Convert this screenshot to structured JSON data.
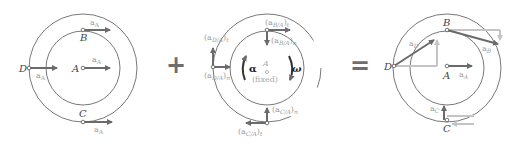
{
  "equation": {
    "plus": "+",
    "equals": "="
  },
  "panel_translation": {
    "points": {
      "A": "A",
      "B": "B",
      "C": "C",
      "D": "D"
    },
    "vector_label": "a",
    "vector_sub": "A"
  },
  "panel_rotation": {
    "center_label": "A",
    "fixed_label": "(fixed)",
    "alpha": "α",
    "omega": "ω",
    "labels": {
      "b_t": {
        "base": "(a",
        "sub": "B/A",
        "close": ")",
        "comp": "t"
      },
      "b_n": {
        "base": "(a",
        "sub": "B/A",
        "close": ")",
        "comp": "n"
      },
      "d_t": {
        "base": "(a",
        "sub": "D/A",
        "close": ")",
        "comp": "t"
      },
      "d_n": {
        "base": "(a",
        "sub": "D/A",
        "close": ")",
        "comp": "n"
      },
      "c_t": {
        "base": "(a",
        "sub": "C/A",
        "close": ")",
        "comp": "t"
      },
      "c_n": {
        "base": "(a",
        "sub": "C/A",
        "close": ")",
        "comp": "n"
      }
    }
  },
  "panel_result": {
    "points": {
      "A": "A",
      "B": "B",
      "C": "C",
      "D": "D"
    },
    "vectors": {
      "a_A": {
        "base": "a",
        "sub": "A"
      },
      "a_B": {
        "base": "a",
        "sub": "B"
      },
      "a_C": {
        "base": "a",
        "sub": "C"
      },
      "a_D": {
        "base": "a",
        "sub": "D"
      }
    }
  },
  "colors": {
    "line": "#555555",
    "arrow_dark": "#6b6b6b",
    "arrow_light": "#c4c4c4",
    "label_light": "#9a9a9a",
    "operator": "#6e6e6e"
  }
}
